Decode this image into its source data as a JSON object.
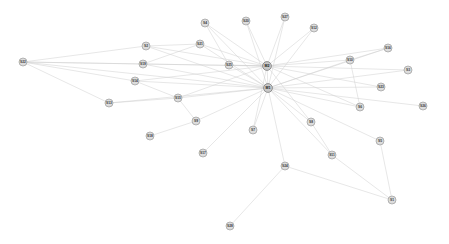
{
  "graph": {
    "type": "node-link-network",
    "title": "",
    "background_color": "#ffffff",
    "edge_color": "#cfcfcf",
    "hub_node_color": "#c8c8c8",
    "leaf_node_color": "#dcdcdc",
    "node_label_color": "#3a3a3a",
    "node_count": 30,
    "edge_count": 62,
    "nodes": [
      {
        "id": "M1",
        "label": "M1",
        "x": 268,
        "y": 88,
        "role": "hub"
      },
      {
        "id": "M2",
        "label": "M2",
        "x": 267,
        "y": 66,
        "role": "hub"
      },
      {
        "id": "S1",
        "label": "S1",
        "x": 392,
        "y": 200,
        "role": "leaf"
      },
      {
        "id": "S2",
        "label": "S2",
        "x": 146,
        "y": 46,
        "role": "leaf"
      },
      {
        "id": "S3",
        "label": "S3",
        "x": 408,
        "y": 70,
        "role": "leaf"
      },
      {
        "id": "S4",
        "label": "S4",
        "x": 205,
        "y": 23,
        "role": "leaf"
      },
      {
        "id": "S5",
        "label": "S5",
        "x": 380,
        "y": 141,
        "role": "leaf"
      },
      {
        "id": "S6",
        "label": "S6",
        "x": 360,
        "y": 107,
        "role": "leaf"
      },
      {
        "id": "S7",
        "label": "S7",
        "x": 253,
        "y": 130,
        "role": "leaf"
      },
      {
        "id": "S8",
        "label": "S8",
        "x": 311,
        "y": 122,
        "role": "leaf"
      },
      {
        "id": "S9",
        "label": "S9",
        "x": 196,
        "y": 121,
        "role": "leaf"
      },
      {
        "id": "S10",
        "label": "S10",
        "x": 350,
        "y": 60,
        "role": "leaf"
      },
      {
        "id": "S11",
        "label": "S11",
        "x": 332,
        "y": 155,
        "role": "leaf"
      },
      {
        "id": "S12",
        "label": "S12",
        "x": 314,
        "y": 28,
        "role": "leaf"
      },
      {
        "id": "S13",
        "label": "S13",
        "x": 109,
        "y": 103,
        "role": "leaf"
      },
      {
        "id": "S14",
        "label": "S14",
        "x": 135,
        "y": 81,
        "role": "leaf"
      },
      {
        "id": "S15",
        "label": "S15",
        "x": 178,
        "y": 98,
        "role": "leaf"
      },
      {
        "id": "S16",
        "label": "S16",
        "x": 388,
        "y": 48,
        "role": "leaf"
      },
      {
        "id": "S17",
        "label": "S17",
        "x": 203,
        "y": 153,
        "role": "leaf"
      },
      {
        "id": "S18",
        "label": "S18",
        "x": 150,
        "y": 136,
        "role": "leaf"
      },
      {
        "id": "S19",
        "label": "S19",
        "x": 143,
        "y": 64,
        "role": "leaf"
      },
      {
        "id": "S20",
        "label": "S20",
        "x": 246,
        "y": 21,
        "role": "leaf"
      },
      {
        "id": "S21",
        "label": "S21",
        "x": 200,
        "y": 44,
        "role": "leaf"
      },
      {
        "id": "S22",
        "label": "S22",
        "x": 23,
        "y": 62,
        "role": "leaf"
      },
      {
        "id": "S23",
        "label": "S23",
        "x": 381,
        "y": 87,
        "role": "leaf"
      },
      {
        "id": "S24",
        "label": "S24",
        "x": 285,
        "y": 166,
        "role": "leaf"
      },
      {
        "id": "S25",
        "label": "S25",
        "x": 229,
        "y": 65,
        "role": "leaf"
      },
      {
        "id": "S26",
        "label": "S26",
        "x": 423,
        "y": 106,
        "role": "leaf"
      },
      {
        "id": "S27",
        "label": "S27",
        "x": 285,
        "y": 17,
        "role": "leaf"
      },
      {
        "id": "S28",
        "label": "S28",
        "x": 230,
        "y": 226,
        "role": "leaf"
      }
    ],
    "edges": [
      {
        "source": "M1",
        "target": "M2"
      },
      {
        "source": "M1",
        "target": "S2"
      },
      {
        "source": "M1",
        "target": "S3"
      },
      {
        "source": "M1",
        "target": "S4"
      },
      {
        "source": "M1",
        "target": "S5"
      },
      {
        "source": "M1",
        "target": "S6"
      },
      {
        "source": "M1",
        "target": "S7"
      },
      {
        "source": "M1",
        "target": "S8"
      },
      {
        "source": "M1",
        "target": "S9"
      },
      {
        "source": "M1",
        "target": "S10"
      },
      {
        "source": "M1",
        "target": "S11"
      },
      {
        "source": "M1",
        "target": "S12"
      },
      {
        "source": "M1",
        "target": "S13"
      },
      {
        "source": "M1",
        "target": "S14"
      },
      {
        "source": "M1",
        "target": "S15"
      },
      {
        "source": "M1",
        "target": "S16"
      },
      {
        "source": "M1",
        "target": "S17"
      },
      {
        "source": "M1",
        "target": "S19"
      },
      {
        "source": "M1",
        "target": "S20"
      },
      {
        "source": "M1",
        "target": "S21"
      },
      {
        "source": "M1",
        "target": "S22"
      },
      {
        "source": "M1",
        "target": "S23"
      },
      {
        "source": "M1",
        "target": "S24"
      },
      {
        "source": "M1",
        "target": "S25"
      },
      {
        "source": "M1",
        "target": "S26"
      },
      {
        "source": "M1",
        "target": "S27"
      },
      {
        "source": "M2",
        "target": "S2"
      },
      {
        "source": "M2",
        "target": "S3"
      },
      {
        "source": "M2",
        "target": "S4"
      },
      {
        "source": "M2",
        "target": "S6"
      },
      {
        "source": "M2",
        "target": "S7"
      },
      {
        "source": "M2",
        "target": "S8"
      },
      {
        "source": "M2",
        "target": "S10"
      },
      {
        "source": "M2",
        "target": "S12"
      },
      {
        "source": "M2",
        "target": "S14"
      },
      {
        "source": "M2",
        "target": "S15"
      },
      {
        "source": "M2",
        "target": "S16"
      },
      {
        "source": "M2",
        "target": "S19"
      },
      {
        "source": "M2",
        "target": "S20"
      },
      {
        "source": "M2",
        "target": "S21"
      },
      {
        "source": "M2",
        "target": "S22"
      },
      {
        "source": "M2",
        "target": "S23"
      },
      {
        "source": "M2",
        "target": "S25"
      },
      {
        "source": "M2",
        "target": "S27"
      },
      {
        "source": "S22",
        "target": "S2"
      },
      {
        "source": "S22",
        "target": "S19"
      },
      {
        "source": "S22",
        "target": "S14"
      },
      {
        "source": "S22",
        "target": "S13"
      },
      {
        "source": "S13",
        "target": "S15"
      },
      {
        "source": "S15",
        "target": "S9"
      },
      {
        "source": "S9",
        "target": "S18"
      },
      {
        "source": "S24",
        "target": "S28"
      },
      {
        "source": "S24",
        "target": "S1"
      },
      {
        "source": "S11",
        "target": "S1"
      },
      {
        "source": "S5",
        "target": "S1"
      },
      {
        "source": "S10",
        "target": "S16"
      },
      {
        "source": "S6",
        "target": "S10"
      },
      {
        "source": "S2",
        "target": "S21"
      },
      {
        "source": "S19",
        "target": "S21"
      },
      {
        "source": "S14",
        "target": "S15"
      },
      {
        "source": "S8",
        "target": "S11"
      },
      {
        "source": "S4",
        "target": "S25"
      }
    ]
  }
}
